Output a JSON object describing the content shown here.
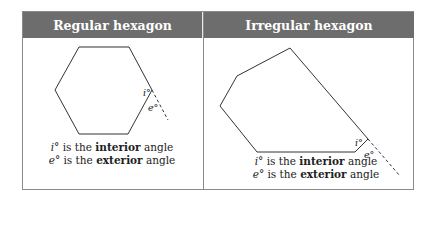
{
  "panels": [
    {
      "title": "Regular hexagon",
      "angle_labels": {
        "interior": "i°",
        "exterior": "e°"
      },
      "caption": [
        {
          "symbol": "i°",
          "pre": " is the ",
          "bold": "interior",
          "post": " angle"
        },
        {
          "symbol": "e°",
          "pre": " is the ",
          "bold": "exterior",
          "post": " angle"
        }
      ]
    },
    {
      "title": "Irregular hexagon",
      "angle_labels": {
        "interior": "i°",
        "exterior": "e°"
      },
      "caption": [
        {
          "symbol": "i°",
          "pre": " is the ",
          "bold": "interior",
          "post": " angle"
        },
        {
          "symbol": "e°",
          "pre": " is the ",
          "bold": "exterior",
          "post": " angle"
        }
      ]
    }
  ],
  "colors": {
    "header_bg": "#6d6d6d",
    "header_text": "#ffffff",
    "border": "#8a8a8a",
    "line": "#333333"
  }
}
